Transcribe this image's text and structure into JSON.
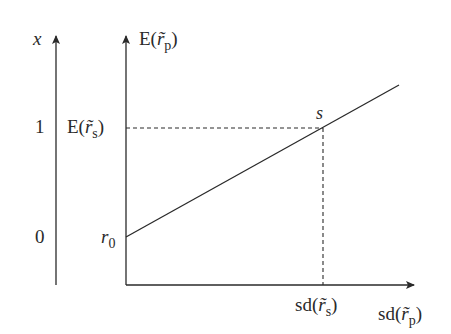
{
  "diagram": {
    "left_axis": {
      "label": "x",
      "tick_top": "1",
      "tick_bottom": "0"
    },
    "right_axis": {
      "label_prefix": "E(",
      "label_var": "r̃",
      "label_sub": "p",
      "label_suffix": ")"
    },
    "y_labels": {
      "es": {
        "prefix": "E(",
        "var": "r̃",
        "sub": "s",
        "suffix": ")"
      },
      "r0": {
        "var": "r",
        "sub": "0"
      }
    },
    "x_labels": {
      "sds": {
        "prefix": "sd(",
        "var": "r̃",
        "sub": "s",
        "suffix": ")"
      },
      "sdp": {
        "prefix": "sd(",
        "var": "r̃",
        "sub": "p",
        "suffix": ")"
      }
    },
    "point_label": "s",
    "colors": {
      "line": "#2a2a2a",
      "background": "#ffffff"
    }
  }
}
